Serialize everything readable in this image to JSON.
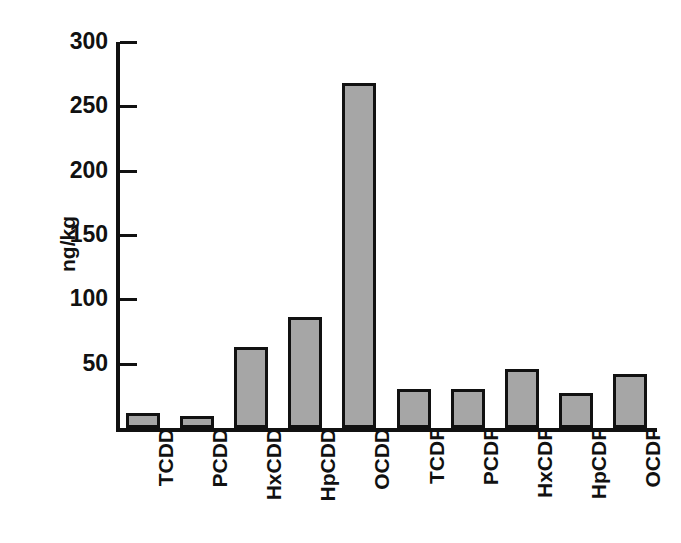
{
  "chart_data": {
    "type": "bar",
    "title": "",
    "xlabel": "",
    "ylabel": "ng/kg",
    "categories": [
      "TCDD",
      "PCDD",
      "HxCDD",
      "HpCDD",
      "OCDD",
      "TCDF",
      "PCDF",
      "HxCDF",
      "HpCDF",
      "OCDF"
    ],
    "values": [
      12,
      9,
      63,
      86,
      268,
      30,
      30,
      46,
      27,
      42
    ],
    "ylim": [
      0,
      300
    ],
    "yticks": [
      0,
      50,
      100,
      150,
      200,
      250,
      300
    ],
    "ytick_labels": [
      "",
      "50",
      "100",
      "150",
      "200",
      "250",
      "300"
    ],
    "grid": false,
    "legend": false,
    "bar_color": "#a6a6a6",
    "bar_edge_color": "#111111",
    "axis_color": "#111111",
    "background": "#ffffff"
  },
  "axis": {
    "y_title": "ng/kg",
    "tick_labels": [
      {
        "text": "300",
        "value": 300
      },
      {
        "text": "250",
        "value": 250
      },
      {
        "text": "200",
        "value": 200
      },
      {
        "text": "150",
        "value": 150
      },
      {
        "text": "100",
        "value": 100
      },
      {
        "text": "50",
        "value": 50
      }
    ]
  },
  "bars": [
    {
      "label": "TCDD",
      "value": 12
    },
    {
      "label": "PCDD",
      "value": 9
    },
    {
      "label": "HxCDD",
      "value": 63
    },
    {
      "label": "HpCDD",
      "value": 86
    },
    {
      "label": "OCDD",
      "value": 268
    },
    {
      "label": "TCDF",
      "value": 30
    },
    {
      "label": "PCDF",
      "value": 30
    },
    {
      "label": "HxCDF",
      "value": 46
    },
    {
      "label": "HpCDF",
      "value": 27
    },
    {
      "label": "OCDF",
      "value": 42
    }
  ]
}
